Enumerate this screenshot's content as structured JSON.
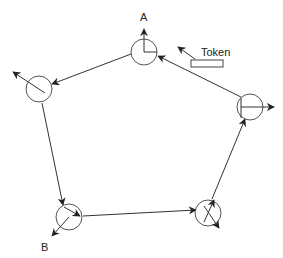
{
  "diagram": {
    "type": "token-ring",
    "labels": {
      "node_a": "A",
      "node_b": "B",
      "token": "Token"
    },
    "nodes": [
      {
        "id": "A",
        "cx": 144,
        "cy": 52,
        "r": 13
      },
      {
        "id": "left",
        "cx": 39,
        "cy": 89,
        "r": 13
      },
      {
        "id": "B",
        "cx": 69,
        "cy": 217,
        "r": 13
      },
      {
        "id": "bottom-right",
        "cx": 208,
        "cy": 213,
        "r": 13
      },
      {
        "id": "right",
        "cx": 250,
        "cy": 107,
        "r": 13
      }
    ],
    "ring_direction": "counter-clockwise (A → left → B → bottom-right → right → A)",
    "colors": {
      "line": "#333333",
      "circle": "#555555",
      "background": "#ffffff"
    }
  }
}
